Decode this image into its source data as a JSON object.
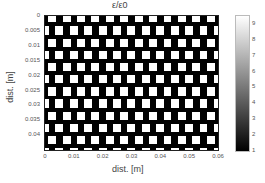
{
  "chart_data": {
    "type": "heatmap",
    "title": "ε/ε0",
    "xlabel": "dist. [m]",
    "ylabel": "dist. [m]",
    "x_ticks": [
      "0",
      "0.01",
      "0.02",
      "0.03",
      "0.04",
      "0.05",
      "0.06"
    ],
    "y_ticks": [
      "0",
      "0.005",
      "0.01",
      "0.015",
      "0.02",
      "0.025",
      "0.03",
      "0.035",
      "0.04"
    ],
    "xlim": [
      0,
      0.06
    ],
    "ylim": [
      0,
      0.045
    ],
    "y_direction": "reversed",
    "colormap": "gray",
    "colorbar": {
      "range": [
        1,
        9.5
      ],
      "ticks": [
        "1",
        "2",
        "3",
        "4",
        "5",
        "6",
        "7",
        "8",
        "9"
      ]
    },
    "pattern": {
      "description": "brick-like checkerboard of high-permittivity (white, ~9) square inclusions on low-permittivity (black, 1) background, alternate rows offset by half a period",
      "rows": 11,
      "columns": 12,
      "high_value": 9,
      "low_value": 1
    },
    "grid": false,
    "legend": "colorbar right"
  }
}
